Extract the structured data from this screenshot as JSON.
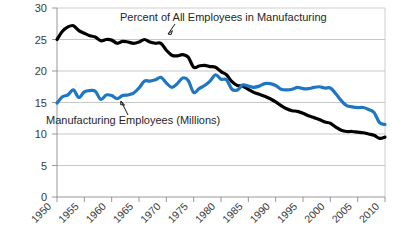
{
  "chart_data": {
    "type": "line",
    "title": "",
    "subtitle": "",
    "xlabel": "",
    "ylabel": "",
    "xlim": [
      1950,
      2010
    ],
    "ylim": [
      0,
      30
    ],
    "grid": true,
    "legend_position": "inline-annotations",
    "x_tick_labels": [
      "1950",
      "1955",
      "1960",
      "1965",
      "1970",
      "1975",
      "1980",
      "1985",
      "1990",
      "1995",
      "2000",
      "2005",
      "2010"
    ],
    "y_tick_labels": [
      "0",
      "5",
      "10",
      "15",
      "20",
      "25",
      "30"
    ],
    "x_ticks": [
      1950,
      1955,
      1960,
      1965,
      1970,
      1975,
      1980,
      1985,
      1990,
      1995,
      2000,
      2005,
      2010
    ],
    "y_ticks": [
      0,
      5,
      10,
      15,
      20,
      25,
      30
    ],
    "annotations": [
      {
        "name": "percent-series-annotation",
        "text": "Percent of All Employees in Manufacturing",
        "color": "#000000"
      },
      {
        "name": "millions-series-annotation",
        "text": "Manufacturing Employees (Millions)",
        "color": "#1f77c4"
      }
    ],
    "x": [
      1950,
      1951,
      1952,
      1953,
      1954,
      1955,
      1956,
      1957,
      1958,
      1959,
      1960,
      1961,
      1962,
      1963,
      1964,
      1965,
      1966,
      1967,
      1968,
      1969,
      1970,
      1971,
      1972,
      1973,
      1974,
      1975,
      1976,
      1977,
      1978,
      1979,
      1980,
      1981,
      1982,
      1983,
      1984,
      1985,
      1986,
      1987,
      1988,
      1989,
      1990,
      1991,
      1992,
      1993,
      1994,
      1995,
      1996,
      1997,
      1998,
      1999,
      2000,
      2001,
      2002,
      2003,
      2004,
      2005,
      2006,
      2007,
      2008,
      2009,
      2010
    ],
    "series": [
      {
        "name": "Percent of All Employees in Manufacturing",
        "color": "#000000",
        "unit": "percent",
        "values": [
          25.0,
          26.3,
          27.0,
          27.2,
          26.4,
          26.0,
          25.6,
          25.4,
          24.8,
          25.0,
          24.9,
          24.4,
          24.7,
          24.6,
          24.4,
          24.6,
          25.0,
          24.6,
          24.4,
          24.4,
          23.3,
          22.5,
          22.4,
          22.6,
          22.2,
          20.6,
          20.8,
          20.9,
          20.7,
          20.6,
          19.9,
          19.4,
          18.3,
          17.7,
          17.6,
          17.1,
          16.6,
          16.3,
          16.0,
          15.6,
          15.1,
          14.5,
          14.0,
          13.7,
          13.6,
          13.3,
          12.9,
          12.6,
          12.3,
          11.9,
          11.7,
          11.1,
          10.6,
          10.4,
          10.4,
          10.3,
          10.2,
          10.0,
          9.8,
          9.3,
          9.5
        ]
      },
      {
        "name": "Manufacturing Employees (Millions)",
        "color": "#1f77c4",
        "unit": "millions",
        "values": [
          14.9,
          15.9,
          16.2,
          17.0,
          15.8,
          16.7,
          16.9,
          16.8,
          15.5,
          16.2,
          16.1,
          15.6,
          16.1,
          16.2,
          16.5,
          17.3,
          18.4,
          18.4,
          18.6,
          19.0,
          18.1,
          17.4,
          18.0,
          18.9,
          18.5,
          16.6,
          17.2,
          17.7,
          18.4,
          19.4,
          18.7,
          18.6,
          17.1,
          17.0,
          17.8,
          17.6,
          17.4,
          17.6,
          18.0,
          18.0,
          17.7,
          17.1,
          17.0,
          17.1,
          17.4,
          17.2,
          17.2,
          17.4,
          17.5,
          17.3,
          17.3,
          16.4,
          15.3,
          14.5,
          14.3,
          14.2,
          14.2,
          13.9,
          13.4,
          11.8,
          11.5
        ]
      }
    ]
  }
}
